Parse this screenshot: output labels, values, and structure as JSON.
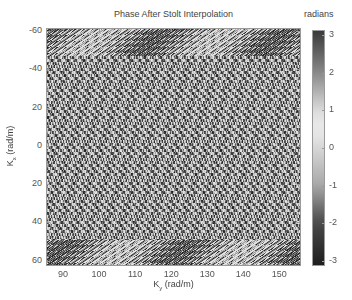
{
  "chart_data": {
    "type": "heatmap",
    "title": "Phase After Stolt Interpolation",
    "xlabel": "K_y (rad/m)",
    "xlabel_main": "K",
    "xlabel_sub": "y",
    "xlabel_unit": " (rad/m)",
    "ylabel": "K_x (rad/m)",
    "ylabel_main": "K",
    "ylabel_sub": "x",
    "ylabel_unit": " (rad/m)",
    "xlim": [
      85.3,
      156
    ],
    "ylim": [
      -61.6,
      62.8
    ],
    "y_reversed": true,
    "xticks": [
      90,
      100,
      110,
      120,
      130,
      140,
      150
    ],
    "yticks": [
      -60,
      -40,
      -20,
      0,
      20,
      40,
      60
    ],
    "ytick_labels": [
      "-60",
      "-40",
      "20",
      "0",
      "20",
      "40",
      "60"
    ],
    "colorbar": {
      "label": "radians",
      "range": [
        -3.14,
        3.14
      ],
      "ticks": [
        3,
        2,
        1,
        0,
        -1,
        -2,
        -3
      ],
      "tick_labels": [
        "3",
        "2",
        "1",
        "0",
        "-1",
        "-2",
        "-3"
      ],
      "colormap": "cyclic gray (dark at ±π, light near 0.5)",
      "stops": [
        {
          "value": 3.14,
          "color": "#3a3a3a"
        },
        {
          "value": 2.0,
          "color": "#8a8a8a"
        },
        {
          "value": 1.0,
          "color": "#dcdcdc"
        },
        {
          "value": 0.5,
          "color": "#ececec"
        },
        {
          "value": 0.0,
          "color": "#d6d6d6"
        },
        {
          "value": -1.0,
          "color": "#a8a8a8"
        },
        {
          "value": -2.0,
          "color": "#4a4a4a"
        },
        {
          "value": -3.14,
          "color": "#1e1e1e"
        }
      ]
    },
    "pattern": {
      "description": "Fine phase-wrapped weave/checkerboard texture across whole domain with diagonal zigzag stripes near top and bottom edges",
      "cell_w": 4,
      "cell_h": 3,
      "edge_band_rows": 9
    },
    "grid": false,
    "legend": "none"
  }
}
